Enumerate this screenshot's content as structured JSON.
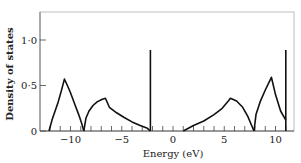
{
  "chart_data": {
    "type": "line",
    "title": "",
    "xlabel": "Energy (eV)",
    "ylabel": "Density of states",
    "xlim": [
      -12.5,
      12
    ],
    "ylim": [
      0,
      1.3
    ],
    "grid": false,
    "legend": null,
    "x_ticks": [
      -10,
      -5,
      0,
      5,
      10
    ],
    "x_tick_labels": [
      "−10",
      "−5",
      "0",
      "5",
      "10"
    ],
    "x_minor_tick_step": 1,
    "y_ticks": [
      0,
      0.5,
      1.0
    ],
    "y_tick_labels": [
      "0",
      "0·5",
      "1·0"
    ],
    "series": [
      {
        "name": "lower band (part 1)",
        "x": [
          -12.1,
          -11.8,
          -11.5,
          -11.2,
          -10.9,
          -10.6,
          -10.3,
          -10.0,
          -9.6,
          -9.2,
          -8.9,
          -8.7
        ],
        "y": [
          0.0,
          0.12,
          0.22,
          0.32,
          0.44,
          0.57,
          0.5,
          0.42,
          0.3,
          0.18,
          0.08,
          0.0
        ]
      },
      {
        "name": "lower band (part 2)",
        "x": [
          -8.7,
          -8.5,
          -8.2,
          -7.8,
          -7.4,
          -6.9,
          -6.6,
          -6.2,
          -5.5,
          -4.8,
          -4.0,
          -3.2,
          -2.5,
          -2.2
        ],
        "y": [
          0.0,
          0.14,
          0.22,
          0.28,
          0.32,
          0.35,
          0.36,
          0.26,
          0.2,
          0.15,
          0.1,
          0.06,
          0.03,
          0.0
        ]
      },
      {
        "name": "lower delta peak",
        "x": [
          -2.2,
          -2.2
        ],
        "y": [
          0.0,
          0.89
        ]
      },
      {
        "name": "upper band (part 1)",
        "x": [
          1.0,
          2.0,
          3.0,
          4.0,
          4.8,
          5.4,
          5.6,
          6.2,
          6.8,
          7.3,
          7.6,
          7.9
        ],
        "y": [
          0.0,
          0.06,
          0.11,
          0.18,
          0.25,
          0.33,
          0.36,
          0.33,
          0.26,
          0.16,
          0.08,
          0.0
        ]
      },
      {
        "name": "upper band (part 2)",
        "x": [
          7.9,
          8.1,
          8.5,
          9.0,
          9.6,
          10.0,
          10.5,
          11.0
        ],
        "y": [
          0.0,
          0.18,
          0.32,
          0.45,
          0.59,
          0.4,
          0.22,
          0.12
        ]
      },
      {
        "name": "upper delta peak",
        "x": [
          11.0,
          11.0
        ],
        "y": [
          0.0,
          0.89
        ]
      }
    ]
  }
}
